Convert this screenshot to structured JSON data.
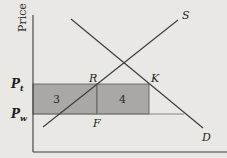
{
  "diagram": {
    "type": "supply-demand-tariff",
    "colors": {
      "background": "#e9e8e4",
      "axis": "#3a3a3a",
      "line": "#3a3a3a",
      "shade": "#a9a8a5",
      "shade_border": "#555555",
      "price_line": "#7a7a7a"
    },
    "axis": {
      "y_label": "Price"
    },
    "price_levels": {
      "pt_label_main": "P",
      "pt_label_sub": "t",
      "pw_label_main": "P",
      "pw_label_sub": "w"
    },
    "curves": {
      "supply_label": "S",
      "demand_label": "D"
    },
    "points": {
      "r_label": "R",
      "k_label": "K",
      "f_label": "F"
    },
    "areas": {
      "area3_label": "3",
      "area4_label": "4"
    }
  }
}
